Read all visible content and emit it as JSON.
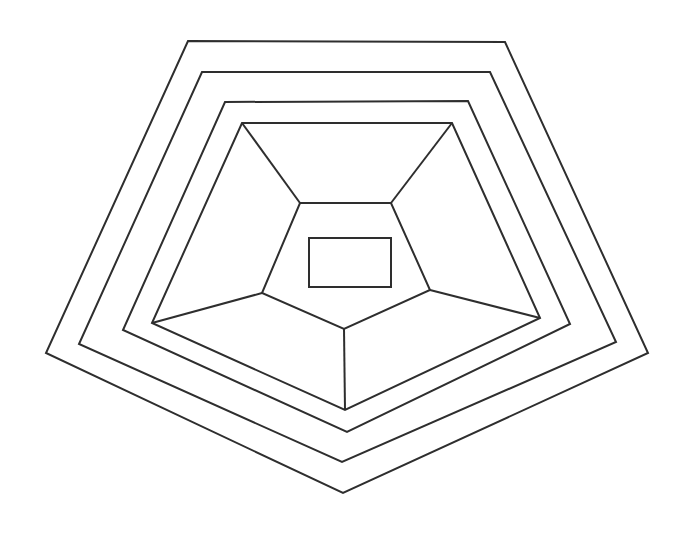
{
  "figure": {
    "type": "line-drawing",
    "canvas": {
      "width": 695,
      "height": 544,
      "background": "#ffffff"
    },
    "stroke": {
      "color": "#2e2e2e",
      "width": 2,
      "fill": "none"
    }
  },
  "chart_data": {
    "type": "line",
    "xlabel": "",
    "ylabel": "",
    "xlim": [
      0,
      695
    ],
    "ylim": [
      0,
      544
    ],
    "grid": false,
    "legend": "none",
    "shapes": [
      {
        "name": "pentagon-ring-1",
        "label": "Outermost pentagon",
        "closed": true,
        "points": [
          [
            188,
            41
          ],
          [
            505,
            42
          ],
          [
            648,
            353
          ],
          [
            343,
            493
          ],
          [
            46,
            353
          ]
        ]
      },
      {
        "name": "pentagon-ring-2",
        "label": "Second pentagon",
        "closed": true,
        "points": [
          [
            202,
            72
          ],
          [
            490,
            72
          ],
          [
            616,
            342
          ],
          [
            342,
            462
          ],
          [
            79,
            344
          ]
        ]
      },
      {
        "name": "pentagon-ring-3",
        "label": "Third pentagon",
        "closed": true,
        "points": [
          [
            225,
            102
          ],
          [
            468,
            101
          ],
          [
            570,
            324
          ],
          [
            347,
            432
          ],
          [
            123,
            330
          ]
        ]
      },
      {
        "name": "pentagon-ring-4",
        "label": "Fourth pentagon",
        "closed": true,
        "points": [
          [
            242,
            123
          ],
          [
            452,
            123
          ],
          [
            540,
            318
          ],
          [
            345,
            410
          ],
          [
            152,
            323
          ]
        ]
      },
      {
        "name": "pentagon-ring-5",
        "label": "Innermost pentagon",
        "closed": true,
        "points": [
          [
            300,
            203
          ],
          [
            391,
            203
          ],
          [
            430,
            290
          ],
          [
            344,
            329
          ],
          [
            262,
            293
          ]
        ]
      },
      {
        "name": "center-rectangle",
        "label": "Central rectangle",
        "closed": true,
        "points": [
          [
            309,
            238
          ],
          [
            391,
            238
          ],
          [
            391,
            287
          ],
          [
            309,
            287
          ]
        ]
      }
    ],
    "spokes": [
      {
        "name": "spoke-top-left",
        "from": [
          300,
          203
        ],
        "to": [
          242,
          123
        ]
      },
      {
        "name": "spoke-top-right",
        "from": [
          391,
          203
        ],
        "to": [
          452,
          123
        ]
      },
      {
        "name": "spoke-right",
        "from": [
          430,
          290
        ],
        "to": [
          540,
          318
        ]
      },
      {
        "name": "spoke-bottom",
        "from": [
          344,
          329
        ],
        "to": [
          345,
          410
        ]
      },
      {
        "name": "spoke-left",
        "from": [
          262,
          293
        ],
        "to": [
          152,
          323
        ]
      }
    ]
  }
}
